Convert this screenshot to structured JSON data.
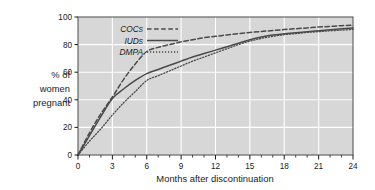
{
  "chart_data": {
    "type": "line",
    "title": "",
    "xlabel": "Months after discontinuation",
    "ylabel": "% of women pregnant",
    "ylabel_lines": [
      "% of",
      "women",
      "pregnant"
    ],
    "xlim": [
      0,
      24
    ],
    "ylim": [
      0,
      100
    ],
    "xticks": [
      0,
      3,
      6,
      9,
      12,
      15,
      18,
      21,
      24
    ],
    "xtick_labels": [
      "0",
      "3",
      "6",
      "9",
      "12",
      "15",
      "18",
      "21",
      "24"
    ],
    "x_minor_tick_interval": 1,
    "yticks": [
      0,
      20,
      40,
      60,
      80,
      100
    ],
    "ytick_labels": [
      "0",
      "20",
      "40",
      "60",
      "80",
      "100"
    ],
    "grid": "white gridlines on gray panel, horizontal at 20/40/60/80 and vertical at every 3 months",
    "legend_position": "top-left inside plot area",
    "plot_background": "#d7d7d7",
    "gridline_color": "#ffffff",
    "line_color": "#4a4a4a",
    "x": [
      0,
      1,
      2,
      3,
      4,
      5,
      6,
      7,
      8,
      9,
      10,
      11,
      12,
      13,
      14,
      15,
      16,
      17,
      18,
      19,
      20,
      21,
      22,
      23,
      24
    ],
    "series": [
      {
        "name": "COCs",
        "style": "dashed",
        "values": [
          0,
          16,
          30,
          42,
          55,
          66,
          75,
          78,
          80,
          82,
          83.5,
          85,
          86,
          87,
          88,
          88.8,
          89.5,
          90.2,
          90.9,
          91.5,
          92.1,
          92.7,
          93.2,
          93.7,
          94
        ]
      },
      {
        "name": "IUDs",
        "style": "solid",
        "values": [
          0,
          14,
          28,
          41,
          48,
          54,
          59,
          62,
          65,
          68,
          71,
          73.5,
          76,
          78.5,
          81,
          83.5,
          85.5,
          87,
          87.8,
          88.6,
          89.4,
          90.1,
          90.8,
          91.4,
          92
        ]
      },
      {
        "name": "DMPA",
        "style": "dotted",
        "values": [
          0,
          10,
          19,
          29,
          38,
          46,
          54,
          57.5,
          61,
          64.5,
          68,
          71,
          74,
          77,
          80,
          82.5,
          84.5,
          86,
          87.2,
          88,
          88.8,
          89.4,
          90,
          90.5,
          91
        ]
      }
    ]
  },
  "legend": {
    "items": [
      {
        "label": "COCs",
        "style": "dashed"
      },
      {
        "label": "IUDs",
        "style": "solid"
      },
      {
        "label": "DMPA",
        "style": "dotted"
      }
    ]
  }
}
